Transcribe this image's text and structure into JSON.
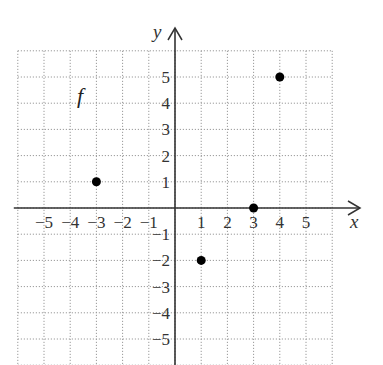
{
  "chart_data": {
    "type": "scatter",
    "title": "",
    "function_label": "f",
    "xlabel": "x",
    "ylabel": "y",
    "xlim": [
      -6,
      6
    ],
    "ylim": [
      -6,
      6
    ],
    "grid": true,
    "grid_style": "dotted",
    "x_ticks": [
      -5,
      -4,
      -3,
      -2,
      -1,
      1,
      2,
      3,
      4,
      5
    ],
    "y_ticks": [
      5,
      4,
      3,
      2,
      1,
      -1,
      -2,
      -3,
      -4,
      -5
    ],
    "x_tick_labels": [
      "−5",
      "−4",
      "−3",
      "−2",
      "−1",
      "1",
      "2",
      "3",
      "4",
      "5"
    ],
    "y_tick_labels": [
      "5",
      "4",
      "3",
      "2",
      "1",
      "−1",
      "−2",
      "−3",
      "−4",
      "−5"
    ],
    "series": [
      {
        "name": "f",
        "points": [
          {
            "x": -3,
            "y": 1
          },
          {
            "x": 1,
            "y": -2
          },
          {
            "x": 3,
            "y": 0
          },
          {
            "x": 4,
            "y": 5
          }
        ]
      }
    ],
    "legend": null
  },
  "colors": {
    "axis": "#333333",
    "grid": "#9a9a9a",
    "point": "#000000",
    "text": "#333333"
  }
}
